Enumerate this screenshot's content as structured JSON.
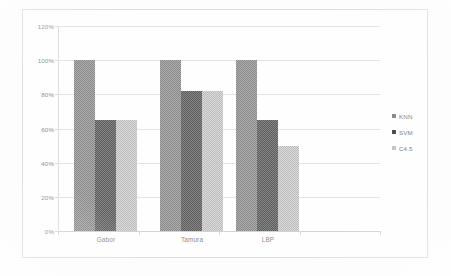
{
  "chart_data": {
    "type": "bar",
    "title": "",
    "xlabel": "",
    "ylabel": "",
    "categories": [
      "Gabor",
      "Tamura",
      "LBP"
    ],
    "series": [
      {
        "name": "KNN",
        "values": [
          100,
          100,
          100
        ],
        "color": "#8a8a8a"
      },
      {
        "name": "SVM",
        "values": [
          65,
          82,
          65
        ],
        "color": "#5e5e5e"
      },
      {
        "name": "C4.5",
        "values": [
          65,
          82,
          50
        ],
        "color": "#bdbdbd"
      }
    ],
    "ylim": [
      0,
      120
    ],
    "ytick_values": [
      0,
      20,
      40,
      60,
      80,
      100,
      120
    ],
    "ytick_labels": [
      "0%",
      "20%",
      "40%",
      "60%",
      "80%",
      "100%",
      "120%"
    ],
    "grid": true,
    "grid_axis": "y",
    "legend_position": "right",
    "value_unit": "%"
  },
  "axes": {
    "y_ticks": [
      {
        "label": "120%",
        "value": 120
      },
      {
        "label": "100%",
        "value": 100
      },
      {
        "label": "80%",
        "value": 80
      },
      {
        "label": "60%",
        "value": 60
      },
      {
        "label": "40%",
        "value": 40
      },
      {
        "label": "20%",
        "value": 20
      },
      {
        "label": "0%",
        "value": 0
      }
    ],
    "x_ticks": [
      {
        "label": "Gabor"
      },
      {
        "label": "Tamura"
      },
      {
        "label": "LBP"
      }
    ]
  },
  "legend": {
    "entries": [
      {
        "label": "KNN",
        "marker": "square-marker",
        "color": "#8a8a8a"
      },
      {
        "label": "SVM",
        "marker": "square-marker",
        "color": "#4d4d4d"
      },
      {
        "label": "C4.5",
        "marker": "square-marker",
        "color": "#c6c6c6"
      }
    ]
  }
}
